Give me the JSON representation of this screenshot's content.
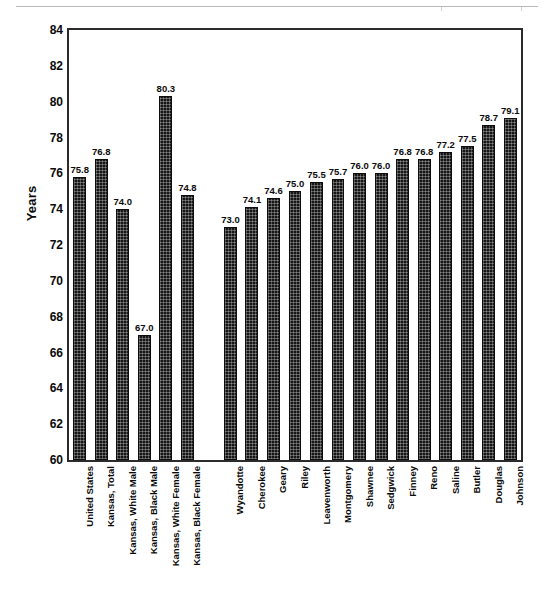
{
  "chart_data": {
    "type": "bar",
    "title": "",
    "subtitle": "",
    "xlabel": "",
    "ylabel": "Years",
    "ylim": [
      60,
      84
    ],
    "ytick_step": 2,
    "yticks": [
      84,
      82,
      80,
      78,
      76,
      74,
      72,
      70,
      68,
      66,
      64,
      62,
      60
    ],
    "grid": false,
    "legend": "none",
    "bar_color": "#161616",
    "value_label_format": "one-decimal",
    "has_group_gap_after_index": 5,
    "categories": [
      "United States",
      "Kansas, Total",
      "Kansas, White Male",
      "Kansas, Black Male",
      "Kansas, White Female",
      "Kansas, Black Female",
      "Wyandotte",
      "Cherokee",
      "Geary",
      "Riley",
      "Leavenworth",
      "Montgomery",
      "Shawnee",
      "Sedgwick",
      "Finney",
      "Reno",
      "Saline",
      "Butler",
      "Douglas",
      "Johnson"
    ],
    "values": [
      75.8,
      76.8,
      74.0,
      67.0,
      80.3,
      74.8,
      73.0,
      74.1,
      74.6,
      75.0,
      75.5,
      75.7,
      76.0,
      76.0,
      76.8,
      76.8,
      77.2,
      77.5,
      78.7,
      79.1
    ],
    "value_labels": [
      "75.8",
      "76.8",
      "74.0",
      "67.0",
      "80.3",
      "74.8",
      "73.0",
      "74.1",
      "74.6",
      "75.0",
      "75.5",
      "75.7",
      "76.0",
      "76.0",
      "76.8",
      "76.8",
      "77.2",
      "77.5",
      "78.7",
      "79.1"
    ]
  }
}
